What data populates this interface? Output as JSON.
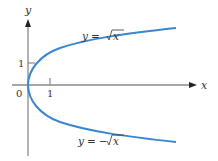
{
  "diagram": {
    "axes": {
      "x_label": "x",
      "y_label": "y",
      "origin_label": "0",
      "x_tick_label": "1",
      "y_tick_label": "1"
    },
    "curves": [
      {
        "name": "upper-branch",
        "equation_lhs": "y =",
        "equation_rhs": "x",
        "sign": "",
        "color": "#3a87cf"
      },
      {
        "name": "lower-branch",
        "equation_lhs": "y =",
        "equation_rhs": "x",
        "sign": "−",
        "color": "#3a87cf"
      }
    ],
    "colors": {
      "axis": "#8a8a8a",
      "curve": "#3a87cf",
      "text": "#333333"
    }
  }
}
